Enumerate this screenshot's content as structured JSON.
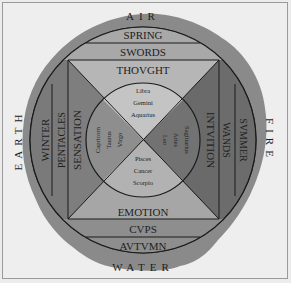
{
  "diagram": {
    "elements": {
      "top": "AIR",
      "right": "FIRE",
      "bottom": "WATER",
      "left": "EARTH"
    },
    "seasons": {
      "top": "SPRING",
      "right": "SVMMER",
      "bottom": "AVTVMN",
      "left": "WINTER"
    },
    "suits": {
      "top": "SWORDS",
      "right": "WANDS",
      "bottom": "CVPS",
      "left": "PENTACLES"
    },
    "functions": {
      "top": "THOVGHT",
      "right": "INTVITION",
      "bottom": "EMOTION",
      "left": "SENSATION"
    },
    "signs": {
      "top": [
        "Libra",
        "Gemini",
        "Aquarius"
      ],
      "right": [
        "Leo",
        "Aries",
        "Sagittarius"
      ],
      "bottom": [
        "Pisces",
        "Cancer",
        "Scorpio"
      ],
      "left": [
        "Capricorn",
        "Taurus",
        "Virgo"
      ]
    },
    "colors": {
      "background": "#eeeeee",
      "stain": "#8c8c8c",
      "light_quadrant": "#b4b4b4",
      "dark_quadrant": "#6e6e6e",
      "outer_band": "#9a9a9a",
      "line": "#1a1a1a"
    }
  }
}
